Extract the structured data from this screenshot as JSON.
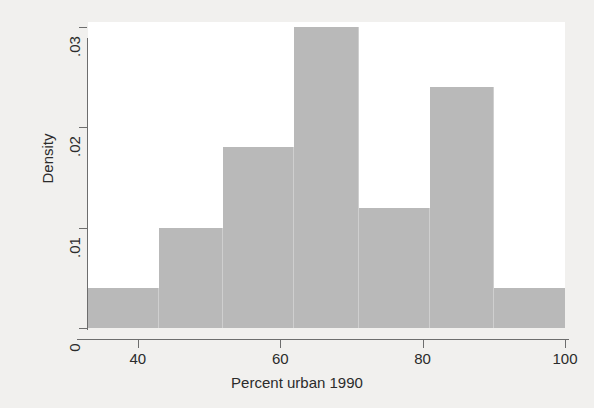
{
  "chart_data": {
    "type": "bar",
    "title": "",
    "subtitle": "",
    "xlabel": "Percent urban 1990",
    "ylabel": "Density",
    "xlim": [
      33,
      100
    ],
    "ylim": [
      0,
      0.0305
    ],
    "grid": false,
    "legend": null,
    "legend_position": "none",
    "histogram": true,
    "bin_edges": [
      33,
      43,
      52,
      62,
      71,
      81,
      90,
      100
    ],
    "categories": [
      "33-43",
      "43-52",
      "52-62",
      "62-71",
      "71-81",
      "81-90",
      "90-100"
    ],
    "values": [
      0.004,
      0.01,
      0.018,
      0.03,
      0.012,
      0.024,
      0.004
    ],
    "xticks": [
      40,
      60,
      80,
      100
    ],
    "xticklabels": [
      "40",
      "60",
      "80",
      "100"
    ],
    "yticks": [
      0,
      0.01,
      0.02,
      0.03
    ],
    "yticklabels": [
      "0",
      ".01",
      ".02",
      ".03"
    ],
    "bar_color": "#b9b9b9",
    "bar_edge_color": "#cfcfcf",
    "plot_background": "#ffffff",
    "figure_background": "#f1f0ee",
    "axis_color": "#6d6d6d",
    "text_color": "#2b2b2b"
  }
}
